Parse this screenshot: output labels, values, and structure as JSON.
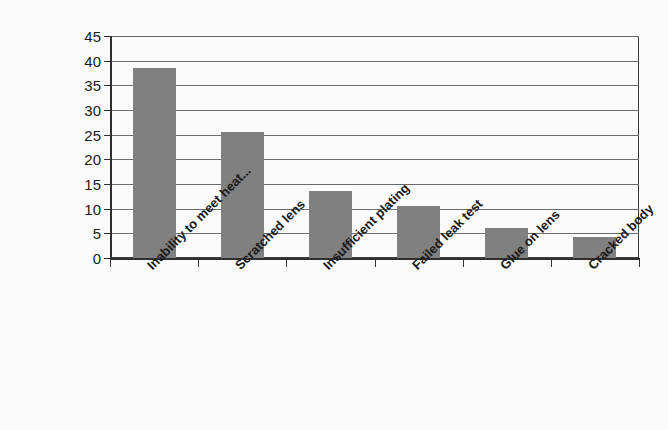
{
  "chart_data": {
    "type": "bar",
    "title": "",
    "subtitle": "",
    "xlabel": "",
    "ylabel": "",
    "categories": [
      "Inability to meet heat...",
      "Scratched lens",
      "Insufficient plating",
      "Failed leak test",
      "Glue on lens",
      "Cracked body"
    ],
    "values": [
      38.6,
      25.5,
      13.5,
      10.6,
      6.0,
      4.3
    ],
    "ylim": [
      0,
      45
    ],
    "yticks": [
      0,
      5,
      10,
      15,
      20,
      25,
      30,
      35,
      40,
      45
    ],
    "ytick_labels": [
      "0",
      "5",
      "10",
      "15",
      "20",
      "25",
      "30",
      "35",
      "40",
      "45"
    ],
    "grid": true,
    "grid_axis": "y",
    "legend": false,
    "legend_position": "none",
    "bar_color": "#808080",
    "axis_color": "#2f2f2f",
    "gridline_color": "#6a6a6a",
    "background_color": "#fbfbfb",
    "label_rotation_degrees": -45
  }
}
